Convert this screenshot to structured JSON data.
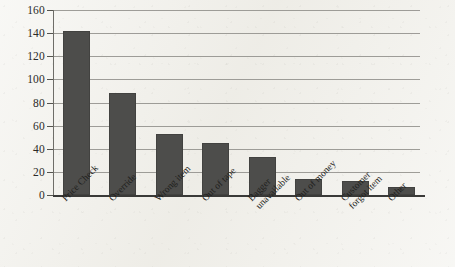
{
  "chart_data": {
    "type": "bar",
    "title": "",
    "subtitle": "",
    "xlabel": "",
    "ylabel": "",
    "ylim": [
      0,
      160
    ],
    "ytick_interval": 20,
    "yticks": [
      0,
      20,
      40,
      60,
      80,
      100,
      120,
      140,
      160
    ],
    "grid": true,
    "legend": false,
    "legend_position": "none",
    "orientation": "vertical",
    "categories": [
      "Price Check",
      "Override",
      "Wrong item",
      "Out of tape",
      "Bagger unavailable",
      "Out of money",
      "Customer forgot item",
      "Other"
    ],
    "category_label_lines": [
      [
        "Price Check"
      ],
      [
        "Override"
      ],
      [
        "Wrong item"
      ],
      [
        "Out of tape"
      ],
      [
        "Bagger",
        "unavailable"
      ],
      [
        "Out of money"
      ],
      [
        "Customer",
        "forgot item"
      ],
      [
        "Other"
      ]
    ],
    "values": [
      142,
      88,
      53,
      45,
      33,
      14,
      12,
      7
    ],
    "series": [
      {
        "name": "Frequency",
        "values": [
          142,
          88,
          53,
          45,
          33,
          14,
          12,
          7
        ]
      }
    ]
  },
  "style": {
    "bar_color": "#4d4d4b",
    "gridline_color": "#8e8d88",
    "axis_color": "#3a3a38",
    "background_color": "#f0efe9",
    "text_color": "#1f1f1d"
  }
}
